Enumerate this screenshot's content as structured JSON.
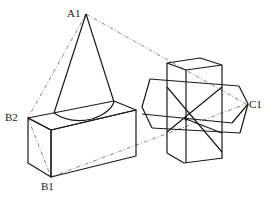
{
  "diagram": {
    "type": "geometric-solids",
    "labels": {
      "A1": "A1",
      "B1": "B1",
      "B2": "B2",
      "C1": "C1"
    },
    "shapes": [
      "cone",
      "rectangular-box",
      "cross-shaped-solid"
    ],
    "colors": {
      "line": "#1a1a1a",
      "dashed": "#7a7a7a",
      "background": "#ffffff"
    }
  }
}
